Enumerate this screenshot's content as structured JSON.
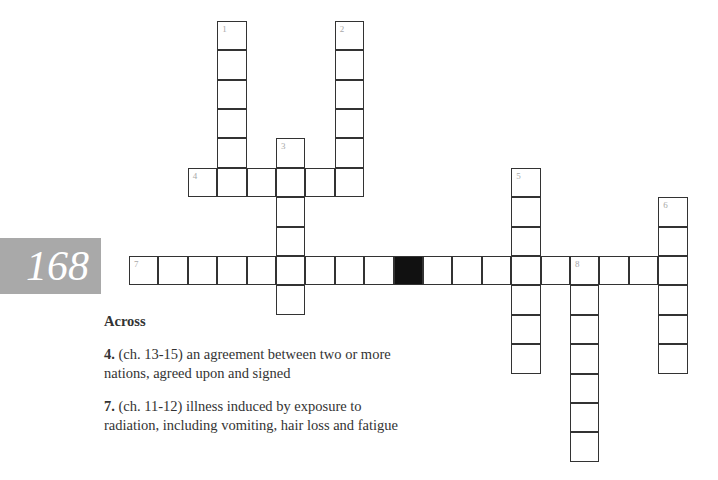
{
  "page": {
    "number": "168"
  },
  "crossword": {
    "origin_x": 129,
    "origin_y": 256,
    "cell": 29.4,
    "words": [
      {
        "num": "1",
        "dir": "down",
        "col": 3,
        "row": -8,
        "len": 6
      },
      {
        "num": "2",
        "dir": "down",
        "col": 7,
        "row": -8,
        "len": 6
      },
      {
        "num": "3",
        "dir": "down",
        "col": 5,
        "row": -4,
        "len": 6
      },
      {
        "num": "4",
        "dir": "across",
        "col": 2,
        "row": -3,
        "len": 6
      },
      {
        "num": "5",
        "dir": "down",
        "col": 13,
        "row": -3,
        "len": 7
      },
      {
        "num": "6",
        "dir": "down",
        "col": 18,
        "row": -2,
        "len": 6
      },
      {
        "num": "7",
        "dir": "across",
        "col": 0,
        "row": 0,
        "len": 19
      },
      {
        "num": "8",
        "dir": "down",
        "col": 15,
        "row": 0,
        "len": 7
      }
    ],
    "black_cells": [
      {
        "col": 9,
        "row": 0
      }
    ]
  },
  "clues": {
    "heading": "Across",
    "items": [
      {
        "num": "4.",
        "text": " (ch. 13-15) an agreement between two or more nations, agreed upon and signed"
      },
      {
        "num": "7.",
        "text": " (ch. 11-12) illness induced by exposure to radiation, including vomiting, hair loss and fatigue"
      }
    ]
  }
}
